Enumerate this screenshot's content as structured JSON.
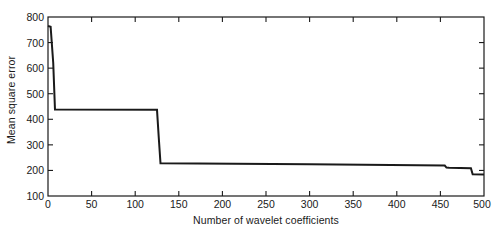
{
  "chart_data": {
    "type": "line",
    "title": "",
    "xlabel": "Number of wavelet coefficients",
    "ylabel": "Mean square error",
    "xlim": [
      0,
      500
    ],
    "ylim": [
      100,
      800
    ],
    "xticks": [
      0,
      50,
      100,
      150,
      200,
      250,
      300,
      350,
      400,
      450,
      500
    ],
    "yticks": [
      100,
      200,
      300,
      400,
      500,
      600,
      700,
      800
    ],
    "xtick_labels": [
      "0",
      "50",
      "100",
      "150",
      "200",
      "250",
      "300",
      "350",
      "400",
      "450",
      "500"
    ],
    "ytick_labels": [
      "100",
      "200",
      "300",
      "400",
      "500",
      "600",
      "700",
      "800"
    ],
    "grid": false,
    "legend": null,
    "line_color": "#1a1a1a",
    "line_width": 2,
    "series": [
      {
        "name": "mean square error",
        "x": [
          0,
          3,
          6,
          8,
          125,
          127,
          129,
          300,
          455,
          457,
          460,
          485,
          487,
          500
        ],
        "y": [
          765,
          762,
          620,
          438,
          437,
          330,
          228,
          224,
          219,
          211,
          210,
          209,
          185,
          184
        ]
      }
    ],
    "annotations": [
      {
        "text": "initial error at zero coefficients",
        "x": 0,
        "y": 765
      },
      {
        "text": "first plateau",
        "x": 60,
        "y": 438
      },
      {
        "text": "major drop near 125 coefficients",
        "x": 126,
        "y": 330
      },
      {
        "text": "long gentle decline",
        "x": 300,
        "y": 224
      },
      {
        "text": "final plateau",
        "x": 495,
        "y": 185
      }
    ]
  },
  "axes": {
    "frame_color": "#1a1a1a",
    "background": "#ffffff",
    "tick_direction": "in"
  }
}
